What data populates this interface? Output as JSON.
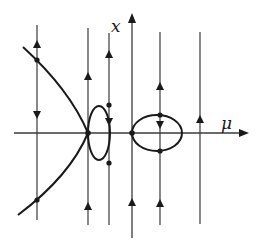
{
  "diagram": {
    "title": "",
    "colors": {
      "line": "#3a3a3a",
      "curve": "#1a1a1a",
      "background": "#ffffff"
    },
    "axes": {
      "vertical_label": "x",
      "horizontal_label": "μ"
    }
  }
}
